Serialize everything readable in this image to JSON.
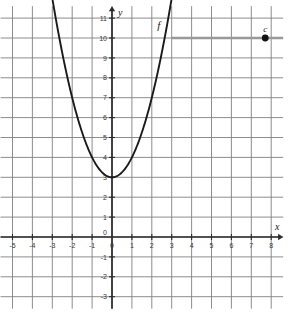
{
  "chart_data": {
    "type": "line",
    "title": "",
    "xlabel": "x",
    "ylabel": "y",
    "xlim": [
      -5.6,
      8.6
    ],
    "ylim": [
      -3.6,
      11.6
    ],
    "grid": true,
    "grid_step": 1,
    "legend": "none",
    "x_ticks": [
      -5,
      -4,
      -3,
      -2,
      -1,
      0,
      1,
      2,
      3,
      4,
      5,
      6,
      7,
      8
    ],
    "y_ticks": [
      -3,
      -2,
      -1,
      0,
      1,
      2,
      3,
      4,
      5,
      6,
      7,
      8,
      9,
      10,
      11
    ],
    "x_tick_labels": [
      "-5",
      "-4",
      "-3",
      "-2",
      "-1",
      "0",
      "1",
      "2",
      "3",
      "4",
      "5",
      "6",
      "7",
      "8"
    ],
    "y_tick_labels": [
      "-3",
      "-2",
      "-1",
      "0",
      "1",
      "2",
      "3",
      "4",
      "5",
      "6",
      "7",
      "8",
      "9",
      "10",
      "11"
    ],
    "series": [
      {
        "name": "f",
        "label": "f",
        "type": "parabola",
        "equation": "y = x^2 + 3",
        "vertex": [
          0,
          3
        ],
        "color": "#1a1a1a",
        "x_domain": [
          -3.05,
          3.05
        ],
        "points": [
          [
            -3,
            12
          ],
          [
            -2.5,
            9.25
          ],
          [
            -2,
            7
          ],
          [
            -1.5,
            5.25
          ],
          [
            -1,
            4
          ],
          [
            -0.5,
            3.25
          ],
          [
            0,
            3
          ],
          [
            0.5,
            3.25
          ],
          [
            1,
            4
          ],
          [
            1.5,
            5.25
          ],
          [
            2,
            7
          ],
          [
            2.5,
            9.25
          ],
          [
            3,
            12
          ]
        ]
      },
      {
        "name": "horizontal-line",
        "label": "",
        "type": "hline",
        "y": 10,
        "x_start": 3.0,
        "x_end": 8.6,
        "color": "#999999"
      }
    ],
    "annotations": [
      {
        "name": "c",
        "label": "c",
        "type": "point",
        "x": 7.7,
        "y": 10,
        "color": "#111111"
      }
    ],
    "axis_color": "#2b2b2b",
    "grid_color": "#808080",
    "curve_color": "#1a1a1a",
    "hline_color": "#999999",
    "point_color": "#111111"
  },
  "labels": {
    "x_axis": "x",
    "y_axis": "y",
    "function": "f",
    "point": "c"
  }
}
